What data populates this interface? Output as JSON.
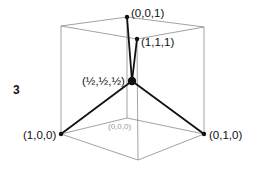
{
  "figure": {
    "panel_number": "3",
    "colors": {
      "cube_edges": "#8a8a8a",
      "bonds": "#111111",
      "atoms": "#111111",
      "hidden_label": "#9a9a9a"
    },
    "labels": {
      "v001": "(0,0,1)",
      "v111": "(1,1,1)",
      "center": "(½,½,½)",
      "v100": "(1,0,0)",
      "v010": "(0,1,0)",
      "v000": "(0,0,0)"
    },
    "cube_vertices": {
      "top_back": [
        127,
        17
      ],
      "top_left": [
        61,
        26
      ],
      "top_right": [
        204,
        27
      ],
      "top_front": [
        137,
        39
      ],
      "bottom_back": [
        127,
        118
      ],
      "bottom_left": [
        61,
        134
      ],
      "bottom_right": [
        204,
        134
      ],
      "bottom_front": [
        138,
        160
      ]
    },
    "atoms": [
      {
        "name": "v001",
        "pos": [
          127,
          17
        ],
        "r": 2.2
      },
      {
        "name": "v111",
        "pos": [
          137,
          39
        ],
        "r": 2.2
      },
      {
        "name": "center",
        "pos": [
          132,
          81
        ],
        "r": 4.2
      },
      {
        "name": "v100",
        "pos": [
          61,
          134
        ],
        "r": 2.2
      },
      {
        "name": "v010",
        "pos": [
          204,
          134
        ],
        "r": 2.2
      }
    ],
    "bonds_from_center_to": [
      "v001",
      "v111",
      "v100",
      "v010"
    ]
  }
}
